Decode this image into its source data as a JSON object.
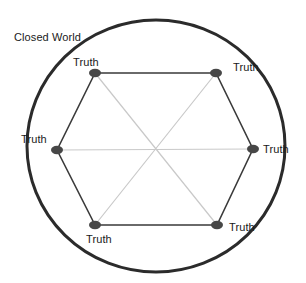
{
  "diagram": {
    "type": "concept-diagram",
    "title": "Closed World",
    "background_color": "#ffffff",
    "boundary": {
      "label": "Closed World",
      "shape": "circle",
      "stroke_color": "#2b2b2b",
      "stroke_width": 3,
      "center_x": 156,
      "center_y": 146,
      "radius": 129,
      "label_x": 14,
      "label_y": 31
    },
    "polygon": {
      "shape": "hexagon",
      "edge_color": "#3a3a3a",
      "edge_width": 1.6,
      "vertex_count": 6
    },
    "diagonals": {
      "color": "#c9c9c9",
      "width": 1.2,
      "count": 3,
      "pairs": [
        [
          0,
          3
        ],
        [
          1,
          4
        ],
        [
          2,
          5
        ]
      ]
    },
    "node_style": {
      "fill_color": "#474747",
      "rx": 6,
      "ry": 4.2
    },
    "nodes": [
      {
        "id": "node-top-left",
        "label": "Truth",
        "x": 95,
        "y": 73,
        "label_x": 73,
        "label_y": 56
      },
      {
        "id": "node-top-right",
        "label": "Truth",
        "x": 216,
        "y": 73,
        "label_x": 233,
        "label_y": 61
      },
      {
        "id": "node-right",
        "label": "Truth",
        "x": 253,
        "y": 149,
        "label_x": 263,
        "label_y": 143
      },
      {
        "id": "node-bottom-right",
        "label": "Truth",
        "x": 217,
        "y": 225,
        "label_x": 229,
        "label_y": 221
      },
      {
        "id": "node-bottom-left",
        "label": "Truth",
        "x": 95,
        "y": 225,
        "label_x": 86,
        "label_y": 233
      },
      {
        "id": "node-left",
        "label": "Truth",
        "x": 57,
        "y": 150,
        "label_x": 21,
        "label_y": 133
      }
    ]
  }
}
